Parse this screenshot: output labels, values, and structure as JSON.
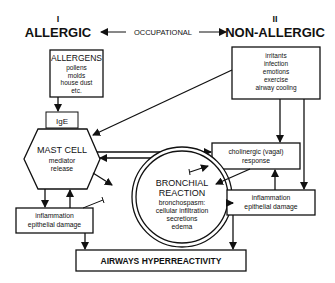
{
  "header": {
    "left_numeral": "I",
    "left_title": "ALLERGIC",
    "middle_label": "OCCUPATIONAL",
    "right_numeral": "II",
    "right_title": "NON-ALLERGIC"
  },
  "nodes": {
    "allergens": {
      "title": "ALLERGENS",
      "items": [
        "pollens",
        "molds",
        "house dust",
        "etc."
      ]
    },
    "ige": {
      "label": "IgE"
    },
    "mast_cell": {
      "title": "MAST CELL",
      "lines": [
        "mediator",
        "release"
      ]
    },
    "nonallergic_triggers": {
      "items": [
        "irritants",
        "infection",
        "emotions",
        "exercise",
        "airway cooling"
      ]
    },
    "cholinergic": {
      "lines": [
        "cholinergic (vagal)",
        "response"
      ]
    },
    "bronchial_reaction": {
      "title_lines": [
        "BRONCHIAL",
        "REACTION"
      ],
      "lines": [
        "bronchospasm:",
        "cellular infiltration",
        "secretions",
        "edema"
      ]
    },
    "inflammation_left": {
      "lines": [
        "inflammation",
        "epithelial damage"
      ]
    },
    "inflammation_right": {
      "lines": [
        "inflammation",
        "epithelial damage"
      ]
    },
    "outcome": {
      "label": "AIRWAYS HYPERREACTIVITY"
    }
  },
  "colors": {
    "ink": "#111111",
    "background": "#ffffff"
  }
}
